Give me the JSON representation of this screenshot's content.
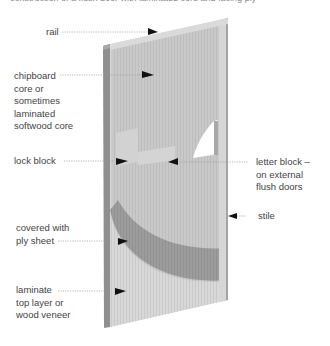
{
  "header": {
    "cut_off_text": "construction of a flush door with laminated core and facing ply"
  },
  "diagram": {
    "colors": {
      "face": "#c8c8c8",
      "face_light": "#d9d9d9",
      "edge_dark": "#8f8f8f",
      "ply_band": "#9a9a9a",
      "arrow": "#111111",
      "leader": "#9a9a9a"
    },
    "labels": [
      {
        "id": "rail",
        "text": "rail"
      },
      {
        "id": "core",
        "text": "chipboard\ncore or\nsometimes\nlaminated\nsoftwood core"
      },
      {
        "id": "lock-block",
        "text": "lock block"
      },
      {
        "id": "letter-block",
        "text": "letter block –\non external\nflush doors"
      },
      {
        "id": "stile",
        "text": "stile"
      },
      {
        "id": "ply",
        "text": "covered with\nply sheet"
      },
      {
        "id": "laminate",
        "text": "laminate\ntop layer or\nwood veneer"
      }
    ]
  }
}
